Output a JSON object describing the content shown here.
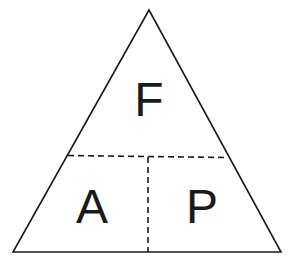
{
  "diagram": {
    "type": "formula-triangle",
    "top_label": "F",
    "bottom_left_label": "A",
    "bottom_right_label": "P",
    "colors": {
      "stroke": "#1a1a1a",
      "background": "#ffffff",
      "text": "#1a1a1a"
    }
  }
}
